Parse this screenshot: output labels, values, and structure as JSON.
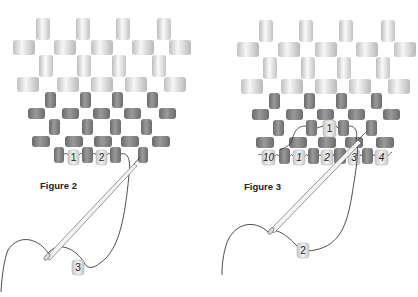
{
  "figures": [
    {
      "id": "figure-2",
      "caption": "Figure 2",
      "bead_labels": [
        "1",
        "2",
        "3"
      ]
    },
    {
      "id": "figure-3",
      "caption": "Figure 3",
      "top_bead_label": "1",
      "bottom_row_labels": [
        "10",
        "1",
        "2",
        "3",
        "4"
      ],
      "needle_bead_label": "2"
    }
  ],
  "colors": {
    "light_bead": "#e6e6e6",
    "light_bead_edge": "#b5b5b5",
    "dark_bead": "#7d7d7d",
    "dark_bead_edge": "#5e5e5e",
    "numbered_bead": "#dcdcdc",
    "thread": "#222222"
  }
}
